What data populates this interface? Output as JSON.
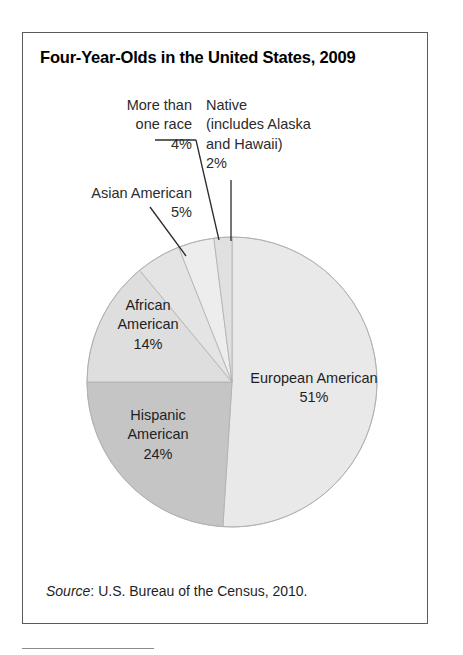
{
  "figure": {
    "title": "Four-Year-Olds in the United States, 2009",
    "source_prefix": "Source",
    "source_text": ": U.S. Bureau of the Census, 2010."
  },
  "labels": {
    "more_than_one_race": "More than\none race\n4%",
    "native": "Native\n(includes Alaska\nand Hawaii)\n2%",
    "asian_american": "Asian American\n5%",
    "african_american": "African\nAmerican\n14%",
    "hispanic_american": "Hispanic\nAmerican\n24%",
    "european_american": "European American\n51%"
  },
  "colors": {
    "european_american": "#e9e9e9",
    "hispanic_american": "#c5c5c5",
    "african_american": "#dedede",
    "asian_american": "#e4e4e4",
    "more_than_one_race": "#ededed",
    "native": "#e0e0e0",
    "wedge_outline": "#b0b0b0",
    "leader_line": "#2b2b2b",
    "box_border": "#5a5a5a"
  },
  "chart_data": {
    "type": "pie",
    "title": "Four-Year-Olds in the United States, 2009",
    "subtitle": "",
    "xlabel": "",
    "ylabel": "",
    "units": "percent",
    "total": 100,
    "start_angle_deg": 0,
    "direction": "clockwise",
    "legend": "none (labels placed on and around slices)",
    "grid": false,
    "categories": [
      "European American",
      "Hispanic American",
      "African American",
      "Asian American",
      "More than one race",
      "Native (includes Alaska and Hawaii)"
    ],
    "values": [
      51,
      24,
      14,
      5,
      4,
      2
    ],
    "value_labels": [
      "51%",
      "24%",
      "14%",
      "5%",
      "4%",
      "2%"
    ],
    "slices": [
      {
        "name": "European American",
        "value": 51,
        "label": "51%",
        "color": "#e9e9e9",
        "label_placement": "inside",
        "start_deg": 0,
        "end_deg": 183.6
      },
      {
        "name": "Hispanic American",
        "value": 24,
        "label": "24%",
        "color": "#c5c5c5",
        "label_placement": "inside",
        "start_deg": 183.6,
        "end_deg": 270.0
      },
      {
        "name": "African American",
        "value": 14,
        "label": "14%",
        "color": "#dedede",
        "label_placement": "inside",
        "start_deg": 270.0,
        "end_deg": 320.4
      },
      {
        "name": "Asian American",
        "value": 5,
        "label": "5%",
        "color": "#e4e4e4",
        "label_placement": "callout",
        "start_deg": 320.4,
        "end_deg": 338.4
      },
      {
        "name": "More than one race",
        "value": 4,
        "label": "4%",
        "color": "#ededed",
        "label_placement": "callout",
        "start_deg": 338.4,
        "end_deg": 352.8
      },
      {
        "name": "Native (includes Alaska and Hawaii)",
        "value": 2,
        "label": "2%",
        "color": "#e0e0e0",
        "label_placement": "callout",
        "start_deg": 352.8,
        "end_deg": 360.0
      }
    ],
    "annotations": [
      "Source: U.S. Bureau of the Census, 2010."
    ]
  }
}
